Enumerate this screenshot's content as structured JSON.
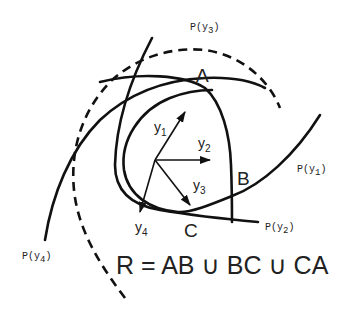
{
  "diagram": {
    "curve_labels": {
      "p_y1": "P(y",
      "p_y1_sub": "1",
      "p_y1_close": ")",
      "p_y2": "P(y",
      "p_y2_sub": "2",
      "p_y2_close": ")",
      "p_y3": "P(y",
      "p_y3_sub": "3",
      "p_y3_close": ")",
      "p_y4": "P(y",
      "p_y4_sub": "4",
      "p_y4_close": ")"
    },
    "vectors": [
      {
        "name": "y",
        "sub": "1"
      },
      {
        "name": "y",
        "sub": "2"
      },
      {
        "name": "y",
        "sub": "3"
      },
      {
        "name": "y",
        "sub": "4"
      }
    ],
    "points": {
      "a": "A",
      "b": "B",
      "c": "C"
    },
    "formula": "R = AB ∪ BC ∪ CA",
    "colors": {
      "stroke": "#111111",
      "text": "#222222",
      "background": "#ffffff"
    }
  }
}
